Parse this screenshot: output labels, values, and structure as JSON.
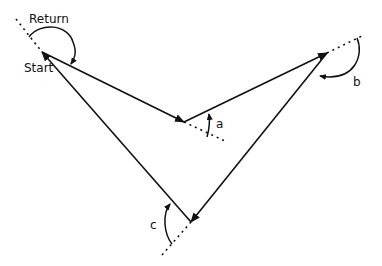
{
  "diagram": {
    "type": "polygon-turning-angles",
    "labels": {
      "return": "Return",
      "start": "Start",
      "angle_a": "a",
      "angle_b": "b",
      "angle_c": "c"
    },
    "vertices": [
      {
        "name": "start",
        "x": 42,
        "y": 52
      },
      {
        "name": "a",
        "x": 184,
        "y": 122
      },
      {
        "name": "b",
        "x": 327,
        "y": 53
      },
      {
        "name": "c",
        "x": 191,
        "y": 222
      }
    ],
    "colors": {
      "stroke": "#111111",
      "background": "#ffffff"
    }
  }
}
